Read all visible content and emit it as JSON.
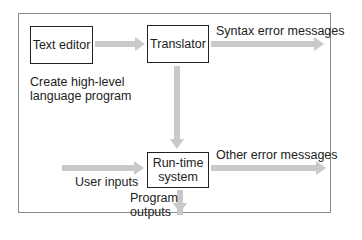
{
  "diagram": {
    "nodes": {
      "text_editor": "Text editor",
      "translator": "Translator",
      "runtime_line1": "Run-time",
      "runtime_line2": "system"
    },
    "labels": {
      "create_line1": "Create high-level",
      "create_line2": "language program",
      "syntax_errors": "Syntax error messages",
      "other_errors": "Other error messages",
      "user_inputs": "User inputs",
      "program_outputs_line1": "Program",
      "program_outputs_line2": "outputs"
    },
    "edges": [
      {
        "from": "Text editor",
        "to": "Translator"
      },
      {
        "from": "Translator",
        "to": "Syntax error messages"
      },
      {
        "from": "Translator",
        "to": "Run-time system"
      },
      {
        "from": "User inputs",
        "to": "Run-time system"
      },
      {
        "from": "Run-time system",
        "to": "Other error messages"
      },
      {
        "from": "Run-time system",
        "to": "Program outputs"
      }
    ],
    "colors": {
      "arrow": "#c9c9c9",
      "box_border": "#222222",
      "frame_border": "#8a8a8a"
    }
  }
}
